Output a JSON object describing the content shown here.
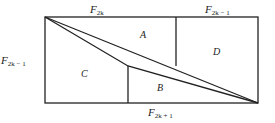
{
  "diagram": {
    "type": "geometric-dissection",
    "stroke_color": "#222222",
    "labels": {
      "top_left": "F",
      "top_left_sub": "2k",
      "top_right": "F",
      "top_right_sub": "2k − 1",
      "left": "F",
      "left_sub": "2k − 1",
      "bottom": "F",
      "bottom_sub": "2k + 1"
    },
    "regions": {
      "a": "A",
      "b": "B",
      "c": "C",
      "d": "D"
    }
  }
}
